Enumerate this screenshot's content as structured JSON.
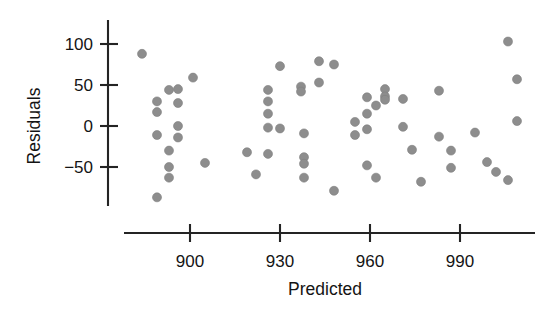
{
  "chart_data": {
    "type": "scatter",
    "title": "",
    "xlabel": "Predicted",
    "ylabel": "Residuals",
    "xlim": [
      880,
      1012
    ],
    "ylim": [
      -100,
      120
    ],
    "xticks": [
      900,
      930,
      960,
      990
    ],
    "xtick_labels": [
      "900",
      "930",
      "960",
      "990"
    ],
    "yticks": [
      -50,
      0,
      50,
      100
    ],
    "ytick_labels": [
      "-50",
      "0",
      "50",
      "100"
    ],
    "grid": false,
    "legend": false,
    "marker": "filled-circle",
    "marker_color": "#8d8d8d",
    "marker_size": 9,
    "n_points": 72,
    "points": [
      {
        "x": 884,
        "y": 88
      },
      {
        "x": 889,
        "y": 30
      },
      {
        "x": 889,
        "y": 17
      },
      {
        "x": 889,
        "y": -11
      },
      {
        "x": 889,
        "y": -87
      },
      {
        "x": 893,
        "y": 44
      },
      {
        "x": 893,
        "y": -30
      },
      {
        "x": 893,
        "y": -50
      },
      {
        "x": 893,
        "y": -63
      },
      {
        "x": 896,
        "y": 45
      },
      {
        "x": 896,
        "y": 28
      },
      {
        "x": 896,
        "y": 0
      },
      {
        "x": 896,
        "y": -14
      },
      {
        "x": 901,
        "y": 59
      },
      {
        "x": 905,
        "y": -45
      },
      {
        "x": 919,
        "y": -32
      },
      {
        "x": 922,
        "y": -59
      },
      {
        "x": 926,
        "y": 44
      },
      {
        "x": 926,
        "y": 30
      },
      {
        "x": 926,
        "y": 15
      },
      {
        "x": 926,
        "y": -2
      },
      {
        "x": 926,
        "y": -34
      },
      {
        "x": 930,
        "y": 73
      },
      {
        "x": 930,
        "y": -3
      },
      {
        "x": 938,
        "y": -9
      },
      {
        "x": 938,
        "y": -38
      },
      {
        "x": 938,
        "y": -46
      },
      {
        "x": 938,
        "y": -63
      },
      {
        "x": 937,
        "y": 48
      },
      {
        "x": 937,
        "y": 42
      },
      {
        "x": 943,
        "y": 53
      },
      {
        "x": 943,
        "y": 79
      },
      {
        "x": 948,
        "y": 75
      },
      {
        "x": 948,
        "y": -79
      },
      {
        "x": 955,
        "y": 5
      },
      {
        "x": 955,
        "y": -11
      },
      {
        "x": 959,
        "y": 35
      },
      {
        "x": 959,
        "y": 15
      },
      {
        "x": 959,
        "y": -4
      },
      {
        "x": 959,
        "y": -48
      },
      {
        "x": 962,
        "y": 25
      },
      {
        "x": 962,
        "y": -63
      },
      {
        "x": 965,
        "y": 45
      },
      {
        "x": 965,
        "y": 36
      },
      {
        "x": 965,
        "y": 32
      },
      {
        "x": 971,
        "y": 33
      },
      {
        "x": 971,
        "y": -1
      },
      {
        "x": 974,
        "y": -29
      },
      {
        "x": 977,
        "y": -68
      },
      {
        "x": 983,
        "y": 43
      },
      {
        "x": 983,
        "y": -13
      },
      {
        "x": 987,
        "y": -30
      },
      {
        "x": 987,
        "y": -51
      },
      {
        "x": 995,
        "y": -8
      },
      {
        "x": 999,
        "y": -44
      },
      {
        "x": 1002,
        "y": -56
      },
      {
        "x": 1006,
        "y": 103
      },
      {
        "x": 1006,
        "y": -66
      },
      {
        "x": 1009,
        "y": 57
      },
      {
        "x": 1009,
        "y": 6
      }
    ]
  },
  "axes": {
    "y_axis_label": "Residuals",
    "x_axis_label": "Predicted"
  }
}
